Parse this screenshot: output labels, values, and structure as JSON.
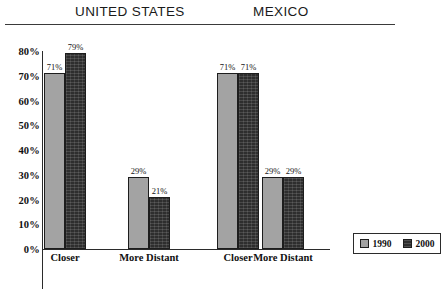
{
  "headers": {
    "left": "UNITED STATES",
    "right": "MEXICO"
  },
  "legend": {
    "entries": [
      {
        "label": "1990",
        "swatch": "swatch-1990",
        "color": "#a3a3a3"
      },
      {
        "label": "2000",
        "swatch": "swatch-2000",
        "color": "#2e2e2e"
      }
    ]
  },
  "chart_data": {
    "type": "bar",
    "title": "",
    "xlabel": "",
    "ylabel": "",
    "ylim": [
      0,
      80
    ],
    "grid": false,
    "legend_position": "bottom-right",
    "ytick_labels": [
      "0%",
      "10%",
      "20%",
      "30%",
      "40%",
      "50%",
      "60%",
      "70%",
      "80%"
    ],
    "ytick_values": [
      0,
      10,
      20,
      30,
      40,
      50,
      60,
      70,
      80
    ],
    "panels": [
      {
        "name": "UNITED STATES",
        "categories": [
          "Closer",
          "More Distant"
        ],
        "series": [
          {
            "name": "1990",
            "values": [
              71,
              29
            ],
            "labels": [
              "71%",
              "29%"
            ]
          },
          {
            "name": "2000",
            "values": [
              79,
              21
            ],
            "labels": [
              "79%",
              "21%"
            ]
          }
        ]
      },
      {
        "name": "MEXICO",
        "categories": [
          "Closer",
          "More Distant"
        ],
        "series": [
          {
            "name": "1990",
            "values": [
              71,
              29
            ],
            "labels": [
              "71%",
              "29%"
            ]
          },
          {
            "name": "2000",
            "values": [
              71,
              29
            ],
            "labels": [
              "71%",
              "29%"
            ]
          }
        ]
      }
    ]
  }
}
